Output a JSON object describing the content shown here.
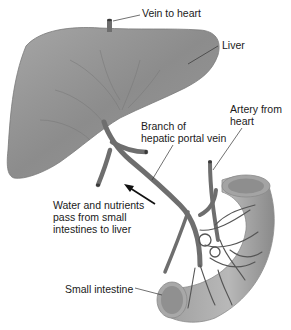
{
  "diagram": {
    "type": "anatomical illustration",
    "labels": {
      "vein_to_heart": "Vein to heart",
      "liver": "Liver",
      "artery_from_heart": "Artery from\nheart",
      "branch_hepatic_portal_vein": "Branch of\nhepatic portal vein",
      "water_nutrients": "Water and nutrients\npass from small\nintestines to liver",
      "small_intestine": "Small intestine"
    },
    "colors": {
      "organ_fill": "#8f8f8f",
      "organ_light": "#b5b5b5",
      "vessel": "#6e6e6e",
      "vessel_dark": "#4a4a4a",
      "text": "#1a1a1a",
      "leader": "#333333"
    }
  }
}
